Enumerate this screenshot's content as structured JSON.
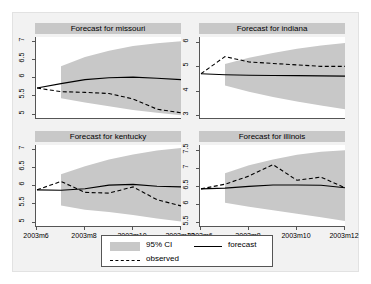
{
  "chart_data": {
    "type": "line",
    "title": "",
    "layout": "2x2 panel grid",
    "grid": false,
    "legend": {
      "position": "bottom-center",
      "entries": [
        {
          "label": "95% CI",
          "style": "shaded-band",
          "color": "#c8c8c8"
        },
        {
          "label": "forecast",
          "style": "solid-line",
          "color": "#000000"
        },
        {
          "label": "observed",
          "style": "dashed-line",
          "color": "#000000"
        }
      ]
    },
    "xlabel": "",
    "ylabel": "",
    "x": [
      "2003m6",
      "2003m7",
      "2003m8",
      "2003m9",
      "2003m10",
      "2003m11",
      "2003m12"
    ],
    "x_ticklabels": [
      "2003m6",
      "2003m8",
      "2003m10",
      "2003m12"
    ],
    "x_tickvalues": [
      2003.5,
      2003.667,
      2003.833,
      2004.0
    ],
    "panels": [
      {
        "title": "Forecast for missouri",
        "ylim": [
          4.85,
          7.1
        ],
        "y_ticklabels": [
          "7",
          "6.5",
          "6",
          "5.5",
          "5"
        ],
        "y_tickvalues": [
          7,
          6.5,
          6,
          5.5,
          5
        ],
        "series": [
          {
            "name": "forecast",
            "style": "solid",
            "values": [
              5.7,
              5.82,
              5.93,
              5.98,
              6.0,
              5.97,
              5.93
            ]
          },
          {
            "name": "observed",
            "style": "dashed",
            "values": [
              5.7,
              5.6,
              5.58,
              5.55,
              5.4,
              5.12,
              5.02
            ]
          },
          {
            "name": "ci_upper",
            "style": "band",
            "values": [
              null,
              6.3,
              6.55,
              6.72,
              6.85,
              6.93,
              6.98
            ]
          },
          {
            "name": "ci_lower",
            "style": "band",
            "values": [
              null,
              5.42,
              5.3,
              5.2,
              5.1,
              5.02,
              4.95
            ]
          }
        ]
      },
      {
        "title": "Forecast for indiana",
        "ylim": [
          2.85,
          6.2
        ],
        "y_ticklabels": [
          "6",
          "5",
          "4",
          "3"
        ],
        "y_tickvalues": [
          6,
          5,
          4,
          3
        ],
        "series": [
          {
            "name": "forecast",
            "style": "solid",
            "values": [
              4.7,
              4.66,
              4.64,
              4.63,
              4.62,
              4.61,
              4.6
            ]
          },
          {
            "name": "observed",
            "style": "dashed",
            "values": [
              4.7,
              5.4,
              5.18,
              5.12,
              5.06,
              5.0,
              5.0
            ]
          },
          {
            "name": "ci_upper",
            "style": "band",
            "values": [
              null,
              5.1,
              5.35,
              5.55,
              5.72,
              5.85,
              5.95
            ]
          },
          {
            "name": "ci_lower",
            "style": "band",
            "values": [
              null,
              4.22,
              3.96,
              3.75,
              3.56,
              3.4,
              3.25
            ]
          }
        ]
      },
      {
        "title": "Forecast for kentucky",
        "ylim": [
          4.85,
          7.1
        ],
        "y_ticklabels": [
          "7",
          "6.5",
          "6",
          "5.5",
          "5"
        ],
        "y_tickvalues": [
          7,
          6.5,
          6,
          5.5,
          5
        ],
        "series": [
          {
            "name": "forecast",
            "style": "solid",
            "values": [
              5.87,
              5.86,
              5.9,
              6.0,
              6.02,
              5.97,
              5.95
            ]
          },
          {
            "name": "observed",
            "style": "dashed",
            "values": [
              5.87,
              6.1,
              5.8,
              5.78,
              5.95,
              5.6,
              5.43
            ]
          },
          {
            "name": "ci_upper",
            "style": "band",
            "values": [
              null,
              6.3,
              6.52,
              6.7,
              6.84,
              6.95,
              7.02
            ]
          },
          {
            "name": "ci_lower",
            "style": "band",
            "values": [
              null,
              5.44,
              5.32,
              5.26,
              5.18,
              5.08,
              5.0
            ]
          }
        ]
      },
      {
        "title": "Forecast for illinois",
        "ylim": [
          5.35,
          7.65
        ],
        "y_ticklabels": [
          "7.5",
          "7",
          "6.5",
          "6",
          "5.5"
        ],
        "y_tickvalues": [
          7.5,
          7,
          6.5,
          6,
          5.5
        ],
        "series": [
          {
            "name": "forecast",
            "style": "solid",
            "values": [
              6.42,
              6.44,
              6.49,
              6.53,
              6.53,
              6.52,
              6.45
            ]
          },
          {
            "name": "observed",
            "style": "dashed",
            "values": [
              6.42,
              6.55,
              6.78,
              7.1,
              6.66,
              6.75,
              6.45
            ]
          },
          {
            "name": "ci_upper",
            "style": "band",
            "values": [
              null,
              6.86,
              7.08,
              7.24,
              7.38,
              7.46,
              7.5
            ]
          },
          {
            "name": "ci_lower",
            "style": "band",
            "values": [
              null,
              6.03,
              5.92,
              5.82,
              5.72,
              5.62,
              5.52
            ]
          }
        ]
      }
    ]
  }
}
